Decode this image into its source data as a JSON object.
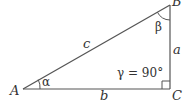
{
  "diagram": {
    "type": "right-triangle",
    "colors": {
      "stroke": "#555555",
      "text": "#333333",
      "background": "#ffffff"
    },
    "vertices": {
      "A": {
        "label": "A",
        "x": 23,
        "y": 89
      },
      "B": {
        "label": "B",
        "x": 170,
        "y": 5
      },
      "C": {
        "label": "C",
        "x": 170,
        "y": 89
      }
    },
    "sides": {
      "a": {
        "label": "a",
        "between": [
          "B",
          "C"
        ]
      },
      "b": {
        "label": "b",
        "between": [
          "A",
          "C"
        ]
      },
      "c": {
        "label": "c",
        "between": [
          "A",
          "B"
        ]
      }
    },
    "angles": {
      "alpha": {
        "label": "α",
        "vertex": "A"
      },
      "beta": {
        "label": "β",
        "vertex": "B"
      },
      "gamma": {
        "label": "γ = 90°",
        "vertex": "C",
        "right_angle": true
      }
    }
  }
}
